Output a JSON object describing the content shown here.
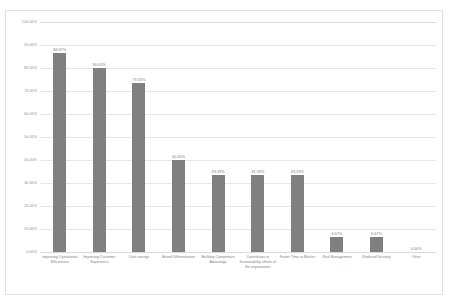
{
  "chart_data": {
    "type": "bar",
    "title": "",
    "xlabel": "",
    "ylabel": "",
    "ylim": [
      0,
      100
    ],
    "grid": true,
    "legend": "none",
    "bar_color": "#808080",
    "gridline_color": "#e6e6e6",
    "axis_label_color": "#8a8a8a",
    "y_ticks": [
      "0.00%",
      "10.00%",
      "20.00%",
      "30.00%",
      "40.00%",
      "50.00%",
      "60.00%",
      "70.00%",
      "80.00%",
      "90.00%",
      "100.00%"
    ],
    "categories": [
      "Improving Operational Efficiencies",
      "Improving Customer Experience",
      "Cost savings",
      "Brand Differentiation",
      "Building Competitive Advantage",
      "Contributes to Sustainability efforts of the organization",
      "Faster Time to Market",
      "Risk Management",
      "Reduced Scrutiny",
      "Other"
    ],
    "values": [
      86.67,
      80.0,
      73.33,
      40.0,
      33.33,
      33.33,
      33.33,
      6.67,
      6.67,
      0.0
    ],
    "data_labels": [
      "86.67%",
      "80.00%",
      "73.33%",
      "40.00%",
      "33.33%",
      "33.33%",
      "33.33%",
      "6.67%",
      "6.67%",
      "0.00%"
    ]
  }
}
